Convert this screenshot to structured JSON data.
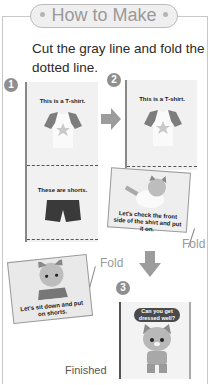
{
  "header": {
    "title": "How to Make"
  },
  "instruction": "Cut the gray line and fold the dotted line.",
  "steps": [
    {
      "number": "1",
      "panels": [
        {
          "text": "This is a T-shirt."
        },
        {
          "text": "These are shorts."
        }
      ]
    },
    {
      "number": "2",
      "panels": [
        {
          "text": "This is a T-shirt."
        },
        {
          "text": "Let's check the front side of the shirt and put it on."
        }
      ],
      "fold_label": "Fold"
    },
    {
      "number": "3",
      "panels": [
        {
          "text": "Can you get dressed well?"
        }
      ],
      "label": "Finished"
    }
  ],
  "left_flap": {
    "text": "Let's sit down and put on shorts.",
    "fold_label": "Fold"
  },
  "colors": {
    "frame": "#c8c8c8",
    "pill_bg": "#efefef",
    "pill_text": "#9a9a9a",
    "step_badge": "#8f8f8f",
    "arrow": "#9c9c9c"
  }
}
